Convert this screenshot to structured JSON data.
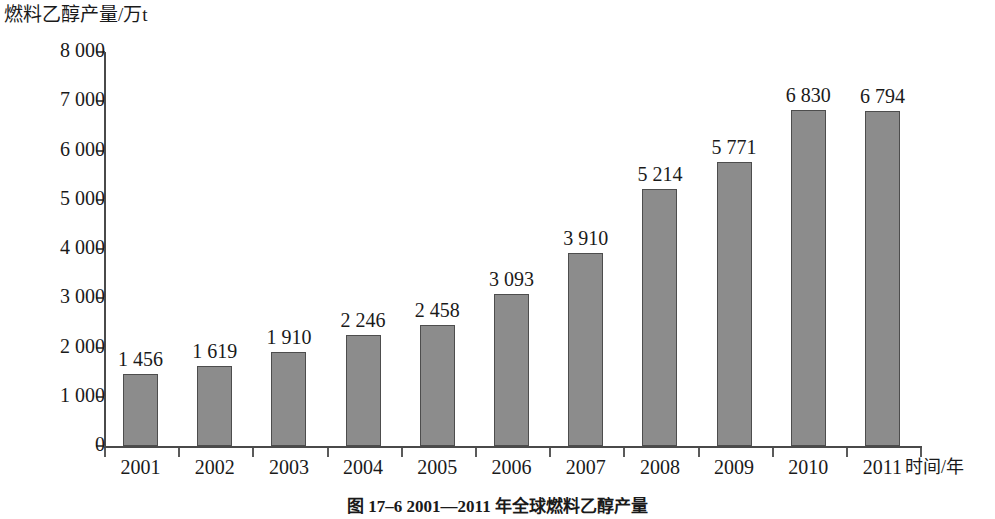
{
  "chart_data": {
    "type": "bar",
    "title": "燃料乙醇产量/万t",
    "caption": "图 17–6   2001—2011 年全球燃料乙醇产量",
    "categories": [
      "2001",
      "2002",
      "2003",
      "2004",
      "2005",
      "2006",
      "2007",
      "2008",
      "2009",
      "2010",
      "2011"
    ],
    "values": [
      1456,
      1619,
      1910,
      2246,
      2458,
      3093,
      3910,
      5214,
      5771,
      6830,
      6794
    ],
    "value_labels": [
      "1 456",
      "1 619",
      "1 910",
      "2 246",
      "2 458",
      "3 093",
      "3 910",
      "5 214",
      "5 771",
      "6 830",
      "6 794"
    ],
    "xlabel": "时间/年",
    "ylabel": "燃料乙醇产量/万t",
    "ylim": [
      0,
      8000
    ],
    "ytick_values": [
      0,
      1000,
      2000,
      3000,
      4000,
      5000,
      6000,
      7000,
      8000
    ],
    "ytick_labels": [
      "0",
      "1 000",
      "2 000",
      "3 000",
      "4 000",
      "5 000",
      "6 000",
      "7 000",
      "8 000"
    ],
    "grid": false,
    "legend": null,
    "series_color": "#8c8c8c",
    "axis_color": "#4a4a4a"
  }
}
